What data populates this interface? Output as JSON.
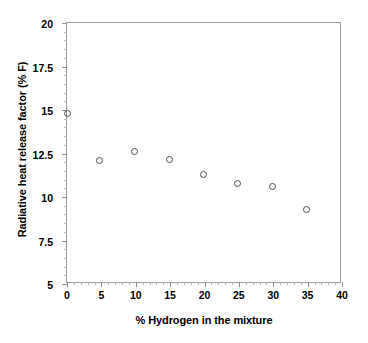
{
  "chart_data": {
    "type": "scatter",
    "title": "",
    "xlabel": "% Hydrogen in the mixture",
    "ylabel": "Radiative heat release factor (% F)",
    "xlim": [
      0,
      40
    ],
    "ylim": [
      5,
      20
    ],
    "grid": false,
    "legend": null,
    "xticks": [
      "0",
      "5",
      "10",
      "15",
      "20",
      "25",
      "30",
      "35",
      "40"
    ],
    "xtick_values": [
      0,
      5,
      10,
      15,
      20,
      25,
      30,
      35,
      40
    ],
    "yticks": [
      "20",
      "17.5",
      "15",
      "12.5",
      "10",
      "7.5",
      "5"
    ],
    "ytick_values": [
      20,
      17.5,
      15,
      12.5,
      10,
      7.5,
      5
    ],
    "marker": "open-circle",
    "marker_color": "#4d4d4d",
    "series": [
      {
        "name": "Radiative heat release factor",
        "points": [
          {
            "x": 0.0,
            "y": 14.85
          },
          {
            "x": 4.7,
            "y": 12.15
          },
          {
            "x": 9.8,
            "y": 12.65
          },
          {
            "x": 14.8,
            "y": 12.2
          },
          {
            "x": 19.8,
            "y": 11.35
          },
          {
            "x": 24.7,
            "y": 10.8
          },
          {
            "x": 29.8,
            "y": 10.65
          },
          {
            "x": 34.8,
            "y": 9.3
          }
        ]
      }
    ]
  }
}
